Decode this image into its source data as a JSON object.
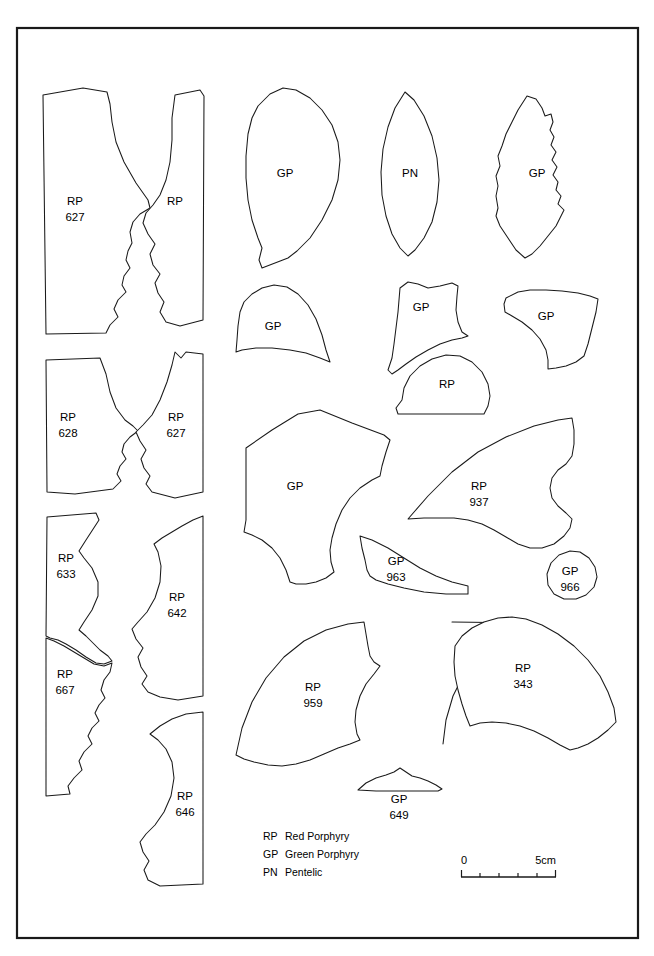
{
  "page": {
    "running_head_folio": "",
    "running_head_title": "",
    "frame": {
      "x": 17,
      "y": 28,
      "width": 621,
      "height": 910
    }
  },
  "materials_key": {
    "title": "",
    "entries": [
      {
        "code": "RP",
        "name": "Red Porphyry"
      },
      {
        "code": "GP",
        "name": "Green Porphyry"
      },
      {
        "code": "PN",
        "name": "Pentelic"
      }
    ]
  },
  "scale_bar": {
    "start_label": "0",
    "end_label": "5cm",
    "divisions": 5
  },
  "fragments": [
    {
      "id": "rp-627-left",
      "material": "RP",
      "catalog": "627",
      "label_x": 75,
      "label_y": 205,
      "num_y": 221
    },
    {
      "id": "rp-627b",
      "material": "RP",
      "catalog": "",
      "label_x": 175,
      "label_y": 205,
      "num_y": 221
    },
    {
      "id": "gp-top-1",
      "material": "GP",
      "catalog": "",
      "label_x": 285,
      "label_y": 177,
      "num_y": 193
    },
    {
      "id": "pn-top",
      "material": "PN",
      "catalog": "",
      "label_x": 410,
      "label_y": 177,
      "num_y": 193
    },
    {
      "id": "gp-top-2",
      "material": "GP",
      "catalog": "",
      "label_x": 537,
      "label_y": 177,
      "num_y": 193
    },
    {
      "id": "rp-628",
      "material": "RP",
      "catalog": "628",
      "label_x": 68,
      "label_y": 421,
      "num_y": 437
    },
    {
      "id": "rp-627c",
      "material": "RP",
      "catalog": "627",
      "label_x": 176,
      "label_y": 421,
      "num_y": 437
    },
    {
      "id": "gp-mid-1",
      "material": "GP",
      "catalog": "",
      "label_x": 273,
      "label_y": 330,
      "num_y": 346
    },
    {
      "id": "gp-mid-2",
      "material": "GP",
      "catalog": "",
      "label_x": 421,
      "label_y": 311,
      "num_y": 327
    },
    {
      "id": "gp-mid-3",
      "material": "GP",
      "catalog": "",
      "label_x": 546,
      "label_y": 320,
      "num_y": 336
    },
    {
      "id": "rp-mid-oval",
      "material": "RP",
      "catalog": "",
      "label_x": 447,
      "label_y": 388,
      "num_y": 404
    },
    {
      "id": "rp-633",
      "material": "RP",
      "catalog": "633",
      "label_x": 66,
      "label_y": 562,
      "num_y": 578
    },
    {
      "id": "rp-642",
      "material": "RP",
      "catalog": "642",
      "label_x": 177,
      "label_y": 601,
      "num_y": 617
    },
    {
      "id": "rp-667",
      "material": "RP",
      "catalog": "667",
      "label_x": 65,
      "label_y": 678,
      "num_y": 694
    },
    {
      "id": "gp-large",
      "material": "GP",
      "catalog": "",
      "label_x": 295,
      "label_y": 490,
      "num_y": 506
    },
    {
      "id": "rp-937",
      "material": "RP",
      "catalog": "937",
      "label_x": 479,
      "label_y": 490,
      "num_y": 506
    },
    {
      "id": "gp-963",
      "material": "GP",
      "catalog": "963",
      "label_x": 396,
      "label_y": 565,
      "num_y": 581
    },
    {
      "id": "gp-966",
      "material": "GP",
      "catalog": "966",
      "label_x": 570,
      "label_y": 575,
      "num_y": 591
    },
    {
      "id": "rp-646",
      "material": "RP",
      "catalog": "646",
      "label_x": 185,
      "label_y": 800,
      "num_y": 816
    },
    {
      "id": "rp-959",
      "material": "RP",
      "catalog": "959",
      "label_x": 313,
      "label_y": 691,
      "num_y": 707
    },
    {
      "id": "rp-343",
      "material": "RP",
      "catalog": "343",
      "label_x": 523,
      "label_y": 672,
      "num_y": 688
    },
    {
      "id": "gp-649",
      "material": "GP",
      "catalog": "649",
      "label_x": 399,
      "label_y": 803,
      "num_y": 819
    }
  ],
  "legend_layout": {
    "code_x": 263,
    "name_x": 285,
    "row_y": [
      840,
      858,
      876
    ]
  },
  "scale_layout": {
    "x1": 461,
    "x2": 556,
    "y": 871,
    "label_y": 864,
    "cap_height": 7
  }
}
